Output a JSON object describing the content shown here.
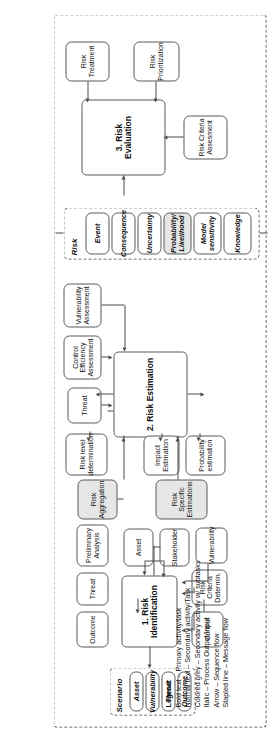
{
  "diagram": {
    "orientation": "rotated-90"
  },
  "phases": {
    "risk_identification": {
      "label": "1. Risk Identification",
      "inputs_top": [
        {
          "label": "Outcome"
        },
        {
          "label": "Threat"
        },
        {
          "label": "Preliminary Analysis"
        }
      ],
      "inputs_bottom": [
        {
          "label": "Asset"
        },
        {
          "label": "Stakeholder"
        }
      ],
      "outputs": [
        {
          "label": "Control"
        },
        {
          "label": "Risk Criteria Determin."
        },
        {
          "label": "Vulnerability"
        }
      ]
    },
    "risk_estimation": {
      "label": "2. Risk Estimation",
      "inputs": [
        {
          "label": "Threat"
        },
        {
          "label": "Control Efficiency Assessment"
        },
        {
          "label": "Vulnerability Assessment"
        }
      ],
      "outputs": [
        {
          "label": "Risk level determination"
        },
        {
          "label": "Impact Estimation"
        },
        {
          "label": "Probability estimation"
        }
      ],
      "grey_outputs": [
        {
          "label": "Risk Aggregation"
        },
        {
          "label": "Risk Specific Estimations"
        }
      ]
    },
    "risk_evaluation": {
      "label": "3. Risk Evaluation",
      "inputs": [
        {
          "label": "Risk Criteria Assesment"
        }
      ],
      "outputs": [
        {
          "label": "Risk Treatment"
        },
        {
          "label": "Risk Prioritization"
        }
      ]
    }
  },
  "pools": {
    "scenario": {
      "title": "Scenario",
      "items": [
        {
          "label": "Asset"
        },
        {
          "label": "Vulnerability"
        },
        {
          "label": "Threat"
        },
        {
          "label": "Outcome"
        }
      ]
    },
    "risk": {
      "title": "Risk",
      "items": [
        {
          "label": "Event"
        },
        {
          "label": "Consequence"
        },
        {
          "label": "Uncertainty"
        },
        {
          "label": "Probability/ Likelihood"
        },
        {
          "label": "Model sensitivity"
        },
        {
          "label": "Knowledge"
        }
      ]
    }
  },
  "legend": {
    "title": "Legend:",
    "lines": [
      "Bold text – Primary activity/task",
      "Normal text – Secondary activity/Task",
      "Colored grey – Secondary activity w/ subtasks",
      "Italic – Process Output/Input",
      "Arrow – Sequence flow",
      "Stapled line – Message flow"
    ]
  },
  "colors": {
    "border": "#595959",
    "dashed": "#4b4b4b",
    "grey_fill": "#e6e6e6",
    "background": "#ffffff",
    "text": "#111111"
  }
}
